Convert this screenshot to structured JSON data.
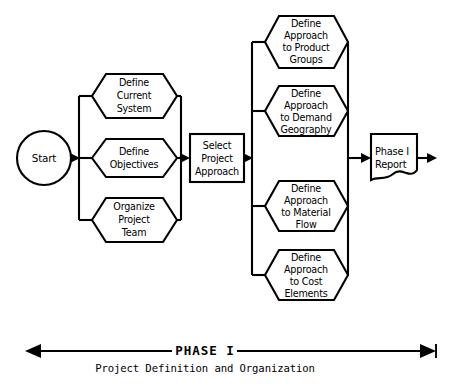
{
  "diagram": {
    "start_node": {
      "label": "Start",
      "shape": "circle"
    },
    "left_group": {
      "shape": "hexagon",
      "nodes": [
        {
          "lines": [
            "Define",
            "Current",
            "System"
          ]
        },
        {
          "lines": [
            "Define",
            "Objectives"
          ]
        },
        {
          "lines": [
            "Organize",
            "Project",
            "Team"
          ]
        }
      ]
    },
    "middle_node": {
      "shape": "rectangle",
      "lines": [
        "Select",
        "Project",
        "Approach"
      ]
    },
    "right_group": {
      "shape": "hexagon",
      "nodes": [
        {
          "lines": [
            "Define",
            "Approach",
            "to Product",
            "Groups"
          ]
        },
        {
          "lines": [
            "Define",
            "Approach",
            "to Demand",
            "Geography"
          ]
        },
        {
          "lines": [
            "Define",
            "Approach",
            "to Material",
            "Flow"
          ]
        },
        {
          "lines": [
            "Define",
            "Approach",
            "to Cost",
            "Elements"
          ]
        }
      ]
    },
    "output_node": {
      "shape": "document",
      "lines": [
        "Phase I",
        "Report"
      ]
    },
    "caption": {
      "title": "PHASE I",
      "subtitle": "Project Definition and Organization"
    },
    "colors": {
      "stroke": "#000000",
      "fill": "#ffffff",
      "background": "#ffffff"
    }
  }
}
